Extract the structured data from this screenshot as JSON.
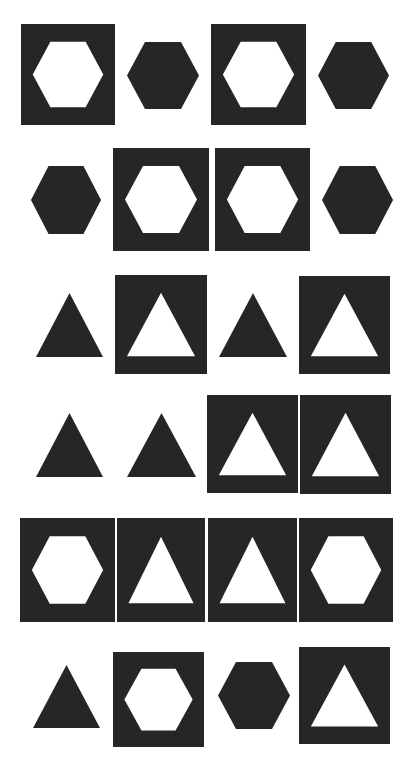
{
  "colors": {
    "background": "#ffffff",
    "ink": "#262626",
    "hole": "#ffffff"
  },
  "rows": [
    {
      "row": 1,
      "tiles": [
        {
          "kind": "framed",
          "shape": "hexagon",
          "x": 21,
          "y": 24,
          "w": 94,
          "h": 101
        },
        {
          "kind": "solid",
          "shape": "hexagon",
          "x": 127,
          "y": 42,
          "w": 72,
          "h": 67
        },
        {
          "kind": "framed",
          "shape": "hexagon",
          "x": 211,
          "y": 24,
          "w": 95,
          "h": 101
        },
        {
          "kind": "solid",
          "shape": "hexagon",
          "x": 318,
          "y": 42,
          "w": 71,
          "h": 67
        }
      ]
    },
    {
      "row": 2,
      "tiles": [
        {
          "kind": "solid",
          "shape": "hexagon",
          "x": 31,
          "y": 166,
          "w": 70,
          "h": 68
        },
        {
          "kind": "framed",
          "shape": "hexagon",
          "x": 113,
          "y": 148,
          "w": 96,
          "h": 103
        },
        {
          "kind": "framed",
          "shape": "hexagon",
          "x": 215,
          "y": 148,
          "w": 95,
          "h": 103
        },
        {
          "kind": "solid",
          "shape": "hexagon",
          "x": 322,
          "y": 166,
          "w": 71,
          "h": 68
        }
      ]
    },
    {
      "row": 3,
      "tiles": [
        {
          "kind": "solid",
          "shape": "triangle",
          "x": 36,
          "y": 293,
          "w": 67,
          "h": 64
        },
        {
          "kind": "framed",
          "shape": "triangle",
          "x": 115,
          "y": 275,
          "w": 92,
          "h": 99
        },
        {
          "kind": "solid",
          "shape": "triangle",
          "x": 219,
          "y": 293,
          "w": 68,
          "h": 64
        },
        {
          "kind": "framed",
          "shape": "triangle",
          "x": 299,
          "y": 276,
          "w": 91,
          "h": 98
        }
      ]
    },
    {
      "row": 4,
      "tiles": [
        {
          "kind": "solid",
          "shape": "triangle",
          "x": 36,
          "y": 413,
          "w": 67,
          "h": 64
        },
        {
          "kind": "solid",
          "shape": "triangle",
          "x": 127,
          "y": 413,
          "w": 69,
          "h": 64
        },
        {
          "kind": "framed",
          "shape": "triangle",
          "x": 207,
          "y": 395,
          "w": 91,
          "h": 98
        },
        {
          "kind": "framed",
          "shape": "triangle",
          "x": 300,
          "y": 395,
          "w": 91,
          "h": 99
        }
      ]
    },
    {
      "row": 5,
      "tiles": [
        {
          "kind": "framed",
          "shape": "hexagon",
          "x": 20,
          "y": 518,
          "w": 95,
          "h": 104
        },
        {
          "kind": "framed",
          "shape": "triangle",
          "x": 117,
          "y": 518,
          "w": 88,
          "h": 104
        },
        {
          "kind": "framed",
          "shape": "triangle",
          "x": 208,
          "y": 518,
          "w": 89,
          "h": 104
        },
        {
          "kind": "framed",
          "shape": "hexagon",
          "x": 299,
          "y": 518,
          "w": 94,
          "h": 104
        }
      ]
    },
    {
      "row": 6,
      "tiles": [
        {
          "kind": "solid",
          "shape": "triangle",
          "x": 33,
          "y": 665,
          "w": 67,
          "h": 63
        },
        {
          "kind": "framed",
          "shape": "hexagon",
          "x": 113,
          "y": 652,
          "w": 91,
          "h": 95
        },
        {
          "kind": "solid",
          "shape": "hexagon",
          "x": 218,
          "y": 662,
          "w": 72,
          "h": 67
        },
        {
          "kind": "framed",
          "shape": "triangle",
          "x": 299,
          "y": 647,
          "w": 91,
          "h": 97
        }
      ]
    }
  ]
}
